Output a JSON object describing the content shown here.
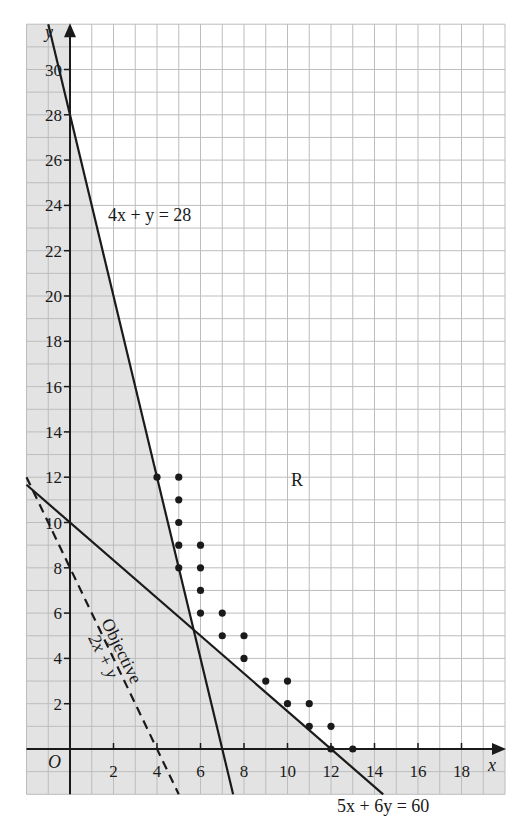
{
  "chart_data": {
    "type": "line",
    "title": "",
    "xlabel": "x",
    "ylabel": "y",
    "origin_label": "O",
    "xlim": [
      -2,
      20
    ],
    "ylim": [
      -2,
      32
    ],
    "grid": true,
    "x_ticks": [
      2,
      4,
      6,
      8,
      10,
      12,
      14,
      16,
      18
    ],
    "y_ticks": [
      2,
      4,
      6,
      8,
      10,
      12,
      14,
      16,
      18,
      20,
      22,
      24,
      26,
      28,
      30
    ],
    "series": [
      {
        "name": "4x + y = 28",
        "style": "solid",
        "points": [
          [
            0,
            28
          ],
          [
            7,
            0
          ]
        ]
      },
      {
        "name": "5x + 6y = 60",
        "style": "solid",
        "points": [
          [
            0,
            10
          ],
          [
            12,
            0
          ]
        ]
      },
      {
        "name": "Objective 2x + y",
        "style": "dashed",
        "points": [
          [
            0,
            8
          ],
          [
            4,
            0
          ]
        ]
      }
    ],
    "feasible_points": [
      [
        4,
        12
      ],
      [
        5,
        12
      ],
      [
        5,
        11
      ],
      [
        5,
        10
      ],
      [
        5,
        9
      ],
      [
        5,
        8
      ],
      [
        6,
        9
      ],
      [
        6,
        8
      ],
      [
        6,
        7
      ],
      [
        6,
        6
      ],
      [
        7,
        6
      ],
      [
        7,
        5
      ],
      [
        8,
        5
      ],
      [
        8,
        4
      ],
      [
        9,
        3
      ],
      [
        10,
        3
      ],
      [
        10,
        2
      ],
      [
        11,
        2
      ],
      [
        11,
        1
      ],
      [
        12,
        1
      ],
      [
        12,
        0
      ],
      [
        13,
        0
      ]
    ],
    "region_label": "R",
    "shaded": "infeasible region (x<0, y<0, and below both constraint lines)",
    "annotations": [
      {
        "text": "4x + y = 28",
        "x": 1.8,
        "y": 23.6
      },
      {
        "text": "5x + 6y = 60",
        "x": 12.4,
        "y": -4.3
      },
      {
        "text": "Objective",
        "along": "dashed line"
      },
      {
        "text": "2x + y",
        "along": "dashed line"
      },
      {
        "text": "R",
        "x": 10.5,
        "y": 11.9
      }
    ]
  },
  "labels": {
    "x_axis": "x",
    "y_axis": "y",
    "origin": "O",
    "region": "R",
    "line1": "4x + y = 28",
    "line2": "5x + 6y = 60",
    "objective_title": "Objective",
    "objective_expr": "2x + y"
  },
  "colors": {
    "shade": "#e3e3e3",
    "grid": "#bdbdbd",
    "ink": "#1a1a1a",
    "background": "#ffffff"
  }
}
